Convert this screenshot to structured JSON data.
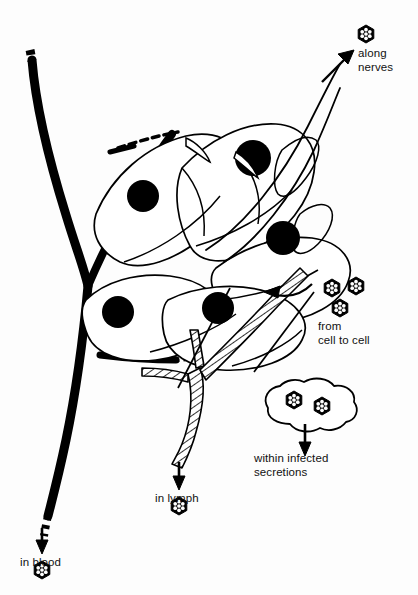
{
  "figure": {
    "background_color": "#fdfdfd",
    "ink_color": "#000000",
    "width": 418,
    "height": 595
  },
  "labels": {
    "along_nerves": "along\nnerves",
    "from_cell_to_cell": "from\ncell to cell",
    "within_infected_secretions": "within infected\nsecretions",
    "in_lymph": "in lymph",
    "in_blood": "in blood"
  },
  "structures": {
    "blood_vessel": "blood-vessel",
    "lymph_vessel": "lymph-vessel",
    "nerve_fibre": "nerve-fibre",
    "cell_sheet": "epithelial-cell-sheet",
    "secretion_droplet": "infected-secretion-droplet"
  },
  "virions": {
    "icon_name": "virus-particle-icon",
    "shape": "hexagon",
    "fill": "#000000",
    "capsomere_dots": 7,
    "dot_color": "#ffffff",
    "groups": [
      {
        "name": "along-nerves-virion",
        "count": 1
      },
      {
        "name": "cell-to-cell-virion-cluster",
        "count": 3
      },
      {
        "name": "secretion-virion-pair",
        "count": 2
      },
      {
        "name": "in-lymph-virion",
        "count": 1
      },
      {
        "name": "in-blood-virion",
        "count": 1
      }
    ],
    "total_visible": 8
  },
  "cells": {
    "name": "spindle-cell",
    "nucleus_color": "#000000",
    "count": 5
  },
  "arrows": [
    {
      "name": "arrow-along-nerves",
      "direction": "up-right"
    },
    {
      "name": "arrow-cell-to-cell",
      "direction": "left"
    },
    {
      "name": "arrow-within-secretions",
      "direction": "down"
    },
    {
      "name": "arrow-in-lymph",
      "direction": "down"
    },
    {
      "name": "arrow-in-blood",
      "direction": "down"
    }
  ]
}
